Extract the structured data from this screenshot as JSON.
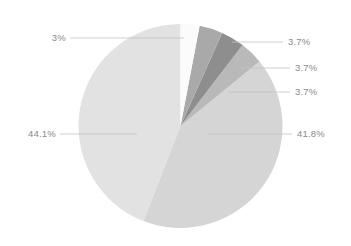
{
  "chart_data": {
    "type": "pie",
    "title": "",
    "subtitle": "",
    "xlabel": "",
    "ylabel": "",
    "legend_position": "none",
    "grid": false,
    "labels": [
      "3%",
      "3.7%",
      "3.7%",
      "3.7%",
      "41.8%",
      "44.1%"
    ],
    "values": [
      3,
      3.7,
      3.7,
      3.7,
      41.8,
      44.1
    ],
    "colors": [
      "#fbfbfb",
      "#a9a9a9",
      "#8e8e8e",
      "#b9b9b9",
      "#d5d5d5",
      "#e2e2e2"
    ],
    "slices": [
      {
        "label": "3%",
        "value": 3,
        "color": "#fbfbfb",
        "label_side": "left"
      },
      {
        "label": "3.7%",
        "value": 3.7,
        "color": "#a9a9a9",
        "label_side": "right"
      },
      {
        "label": "3.7%",
        "value": 3.7,
        "color": "#8e8e8e",
        "label_side": "right"
      },
      {
        "label": "3.7%",
        "value": 3.7,
        "color": "#b9b9b9",
        "label_side": "right"
      },
      {
        "label": "41.8%",
        "value": 41.8,
        "color": "#d5d5d5",
        "label_side": "right"
      },
      {
        "label": "44.1%",
        "value": 44.1,
        "color": "#e2e2e2",
        "label_side": "left"
      }
    ],
    "leader_line_color": "#bfbfbf",
    "label_text_color": "#8a8a8a",
    "background_color": "#ffffff"
  },
  "labels": {
    "top_left": "3%",
    "right_1": "3.7%",
    "right_2": "3.7%",
    "right_3": "3.7%",
    "right_4": "41.8%",
    "left_1": "44.1%"
  }
}
